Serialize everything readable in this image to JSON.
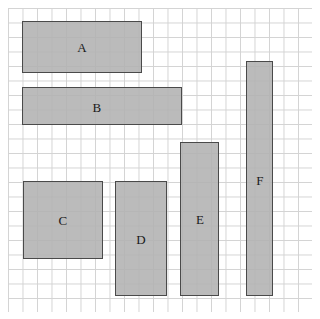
{
  "figure": {
    "background_color": "#ffffff",
    "grid": {
      "visible": true,
      "left": 8,
      "top": 8,
      "width": 304,
      "height": 304,
      "cell_size": 14.5,
      "columns": 21,
      "rows": 21,
      "line_color": "#d3d3d3"
    },
    "shape_style": {
      "fill_color": "#b2b2b2",
      "stroke_color": "#4a4a4a",
      "stroke_width": 1.4,
      "label_color": "#1a1a1a"
    }
  },
  "chart_data": {
    "type": "table",
    "xlabel": "",
    "ylabel": "",
    "columns": [
      "label",
      "x",
      "y",
      "width",
      "height",
      "grid_width",
      "grid_height",
      "grid_area"
    ],
    "grid_cell_px": 14.5,
    "rows": [
      [
        "A",
        22,
        21,
        120,
        52,
        8,
        3.5,
        28
      ],
      [
        "B",
        22,
        87,
        160,
        38,
        11,
        2.5,
        27.5
      ],
      [
        "C",
        23,
        181,
        80,
        78,
        5.5,
        5.5,
        30.25
      ],
      [
        "D",
        115,
        181,
        52,
        115,
        3.5,
        8,
        28
      ],
      [
        "E",
        180,
        142,
        39,
        154,
        2.5,
        10.5,
        26.25
      ],
      [
        "F",
        246,
        61,
        27,
        235,
        2,
        16,
        32
      ]
    ]
  },
  "shapes": [
    {
      "label": "A",
      "x": 22,
      "y": 21,
      "width": 120,
      "height": 52,
      "label_x": 82,
      "label_y": 47
    },
    {
      "label": "B",
      "x": 22,
      "y": 87,
      "width": 160,
      "height": 38,
      "label_x": 97,
      "label_y": 107
    },
    {
      "label": "C",
      "x": 23,
      "y": 181,
      "width": 80,
      "height": 78,
      "label_x": 63,
      "label_y": 220
    },
    {
      "label": "D",
      "x": 115,
      "y": 181,
      "width": 52,
      "height": 115,
      "label_x": 141,
      "label_y": 239
    },
    {
      "label": "E",
      "x": 180,
      "y": 142,
      "width": 39,
      "height": 154,
      "label_x": 200,
      "label_y": 219
    },
    {
      "label": "F",
      "x": 246,
      "y": 61,
      "width": 27,
      "height": 235,
      "label_x": 260,
      "label_y": 180
    }
  ]
}
